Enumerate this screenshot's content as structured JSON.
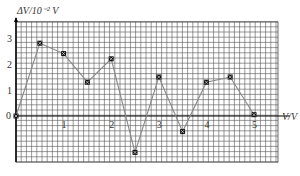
{
  "chart_data": {
    "type": "line",
    "title": "",
    "xlabel": "V/V",
    "ylabel": "ΔV/10⁻² V",
    "x": [
      0,
      0.5,
      1,
      1.5,
      2,
      2.5,
      3,
      3.5,
      4,
      4.5,
      5
    ],
    "series": [
      {
        "name": "ΔV",
        "values": [
          0,
          2.8,
          2.4,
          1.3,
          2.2,
          -1.4,
          1.5,
          -0.6,
          1.3,
          1.5,
          0.05
        ]
      }
    ],
    "x_ticks": [
      "1",
      "2",
      "3",
      "4",
      "5"
    ],
    "y_ticks": [
      "0",
      "1",
      "2",
      "3"
    ],
    "xlim": [
      0,
      5.5
    ],
    "ylim": [
      -1.8,
      3.6
    ],
    "grid": true,
    "marker": "x-square",
    "colors": {
      "grid": "#555555",
      "line": "#888888",
      "marker": "#111111",
      "background": "#ffffff"
    }
  },
  "labels": {
    "ylabel": "ΔV/10⁻² V",
    "xlabel": "V/V",
    "origin": "0"
  }
}
